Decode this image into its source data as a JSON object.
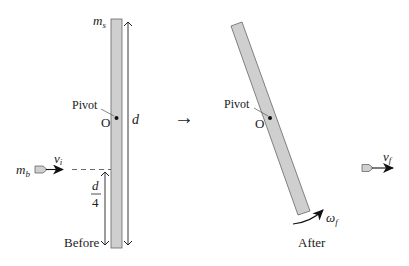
{
  "diagram": {
    "colors": {
      "rod_fill": "#cfcfcf",
      "rod_stroke": "#555555",
      "line": "#222222",
      "background": "#ffffff"
    },
    "before": {
      "caption": "Before",
      "rod_mass_label": "m",
      "rod_mass_sub": "s",
      "length_label": "d",
      "pivot_label": "Pivot",
      "pivot_point_label": "O",
      "bullet_mass_label": "m",
      "bullet_mass_sub": "b",
      "bullet_velocity_label": "v",
      "bullet_velocity_sub": "i",
      "offset_numerator": "d",
      "offset_denominator": "4"
    },
    "transition_arrow": "→",
    "after": {
      "caption": "After",
      "pivot_label": "Pivot",
      "pivot_point_label": "O",
      "angular_velocity_label": "ω",
      "angular_velocity_sub": "f",
      "bullet_velocity_label": "v",
      "bullet_velocity_sub": "f"
    }
  }
}
